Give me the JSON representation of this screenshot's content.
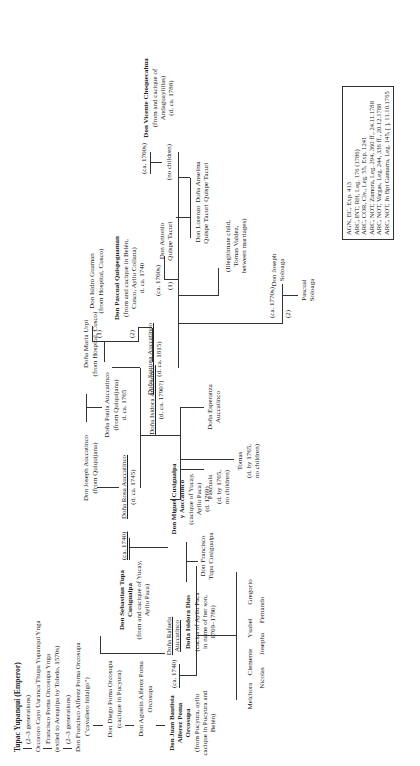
{
  "figure": {
    "orientation": "rotated-90-ccw",
    "root": {
      "name": "Tupac Yupanqui (Emperor)"
    },
    "lineage_left": [
      {
        "id": "gen1",
        "text": "(2–3 generations)"
      },
      {
        "id": "orcororo",
        "text": "Orcororo Cayo Uaranca Thupa Yupanqui Ynga"
      },
      {
        "id": "francisco_poma",
        "name": "Francisco Poma Orcosupa Ynga",
        "note": "(exiled to Arequipa by Toledo, 1570s)"
      },
      {
        "id": "gen2",
        "text": "(2–3 generations)"
      },
      {
        "id": "francisco_alferez",
        "name": "Don Francisco Alferez Poma Orcosupa",
        "note": "(\"cavallero hidalgo\")"
      },
      {
        "id": "diego",
        "name": "Don Diego Poma Orcosupa",
        "note": "(cacique in Pucyura)"
      },
      {
        "id": "agustin",
        "name": "Don Agustin Alferez Poma",
        "name2": "Orcosupa"
      },
      {
        "id": "juan_bautista",
        "name": [
          "Don Juan Bautista",
          "Alferez Poma",
          "Orcosupa"
        ],
        "note": [
          "(from Pucyura, ayllu",
          "cacique in Pucyura and",
          "Belén)"
        ]
      }
    ],
    "marriages": {
      "juan_rafaela": "(ca. 1740)",
      "sebastian_rosa": "(ca. 1740)",
      "santusa_1": "(ca. 1760s)",
      "santusa_1_num": "(1)",
      "santusa_2": "(ca. 1770s)",
      "santusa_2_num": "(2)",
      "paula_1": "(1)",
      "paula_2": "(2)",
      "vicente": "(ca. 1760s)"
    },
    "people": {
      "rafaela": {
        "name": [
          "Doña Rafaela",
          "Auccatinco"
        ]
      },
      "isidora_dias": {
        "name": "Doña Isidora Dias",
        "note": [
          "(cacica of Ayllu Paca",
          "in name of her son,",
          "1769–1780)"
        ]
      },
      "sebastian": {
        "name": [
          "Don Sebastian Tupa",
          "Cusigualpa"
        ],
        "note": [
          "(from and cacique of Yucay,",
          "Ayllu Paca)"
        ]
      },
      "rosa": {
        "name": "Doña Rosa Auccatinco",
        "note": "(d. ca. 1745)"
      },
      "joseph_auccatinco": {
        "name": "Don Joseph Auccatinco",
        "note": "(from Quiquijana)"
      },
      "maria_urpi": {
        "name": "Doña Maria Urpi",
        "note": "(from Hospital, Cusco)"
      },
      "paula": {
        "name": "Doña Paula Auccatinco",
        "note": [
          "(from Quiquijana)",
          "d. ca. 1765"
        ]
      },
      "isidro": {
        "name": "Don Isidro Guaman",
        "note": "(from Hospital, Cusco)"
      },
      "pascual_q": {
        "name": "Don Pascual Quispeguaman",
        "note": [
          "(from and cacique in Belén,",
          "Cusco, Ayllu Collana)",
          "d. ca. 1740"
        ]
      },
      "santusa": {
        "name": "Doña Santusa Auccatinco",
        "note": "(d. ca. 1815)"
      },
      "vicente": {
        "name": "Don Vicente Choquecahua",
        "note": [
          "(from and cacique of",
          "Andaguaylillas)",
          "(d. ca. 1788)"
        ]
      },
      "no_children_v": {
        "text": "(no children)"
      },
      "isidora_a": {
        "name": "Doña Isidora Auccatinco",
        "note": "(d. ca. 1790?)"
      },
      "miguel": {
        "name": [
          "Don Miguel Cusigualpa",
          "y Auccatinco"
        ],
        "note": [
          "(cacique of Yucay,",
          "Ayllu Paca)",
          "(d. 1769)"
        ]
      },
      "pascuala": {
        "name": "Pascuala",
        "note": [
          "(d. by 1765,",
          "no children)"
        ]
      },
      "tomas": {
        "name": "Tomas",
        "note": [
          "(d. by 1765,",
          "no children)"
        ]
      },
      "esperanza": {
        "name": [
          "Doña Esperanza",
          "Auccatinco"
        ]
      },
      "antonio": {
        "name": [
          "Don Antonio",
          "Quispe Tacuri"
        ]
      },
      "lorenzo": {
        "name": [
          "Don Lorenzo",
          "Quispe Tacuri"
        ]
      },
      "anselma": {
        "name": [
          "Doña Anselma",
          "Quispe Tacuri"
        ]
      },
      "illegit": {
        "note": [
          "(Illegitimate child,",
          "Tomas Valdez,",
          "between marriages)"
        ]
      },
      "joseph_sol": {
        "name": [
          "Don Joseph",
          "Soloaga"
        ]
      },
      "pascual_sol": {
        "name": [
          "Pascual",
          "Soloaga"
        ]
      },
      "francisco_tupa": {
        "name": [
          "Don Francisco",
          "Tupa Cusigualpa"
        ]
      }
    },
    "children_isidora_dias": [
      "Melchora",
      "Nicolas",
      "Clemente",
      "Josepha",
      "Ysabel",
      "Fernando",
      "Gregorio"
    ],
    "sources": [
      "AGN, EC, Exp. 413",
      "ARC, INT, RH, Leg. 176 (1786)",
      "ARC, COR, Civ., Leg. 55, Exp. 1241",
      "ARC, NOT, Zamora, Leg. 294, 360 ff., 24.11.1788",
      "ARC, NOT, Vargas, Leg. 244, 336 ff., 20.12.1788",
      "ARC, NOT, Jn Bpt Gamarra, Leg. 145, [ ], 11.10.1765"
    ]
  }
}
